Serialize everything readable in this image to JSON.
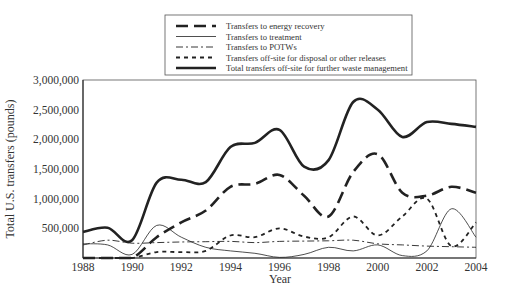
{
  "chart_data": {
    "type": "line",
    "title": "",
    "xlabel": "Year",
    "ylabel": "Total U.S. transfers (pounds)",
    "xlim": [
      1988,
      2004
    ],
    "ylim": [
      0,
      3000000
    ],
    "x_ticks": [
      "1988",
      "1990",
      "1992",
      "1994",
      "1996",
      "1998",
      "2000",
      "2002",
      "2004"
    ],
    "y_ticks": [
      {
        "value": 500000,
        "label": "500,000"
      },
      {
        "value": 1000000,
        "label": "1,000,000"
      },
      {
        "value": 1500000,
        "label": "1,500,000"
      },
      {
        "value": 2000000,
        "label": "2,000,000"
      },
      {
        "value": 2500000,
        "label": "2,500,000"
      },
      {
        "value": 3000000,
        "label": "3,000,000"
      }
    ],
    "grid": false,
    "legend_position": "top-center",
    "x": [
      1988,
      1989,
      1990,
      1991,
      1992,
      1993,
      1994,
      1995,
      1996,
      1997,
      1998,
      1999,
      2000,
      2001,
      2002,
      2003,
      2004
    ],
    "series": [
      {
        "name": "Transfers to energy recovery",
        "style": "long-dash",
        "width": 2.6,
        "values": [
          0,
          0,
          0,
          350000,
          600000,
          800000,
          1200000,
          1250000,
          1400000,
          1050000,
          700000,
          1450000,
          1750000,
          1100000,
          1050000,
          1200000,
          1100000
        ]
      },
      {
        "name": "Transfers to treatment",
        "style": "thin-solid",
        "width": 0.8,
        "values": [
          240000,
          220000,
          60000,
          550000,
          350000,
          180000,
          120000,
          80000,
          10000,
          60000,
          180000,
          120000,
          220000,
          40000,
          120000,
          830000,
          350000
        ]
      },
      {
        "name": "Transfers to POTWs",
        "style": "dash-dot",
        "width": 0.9,
        "values": [
          220000,
          300000,
          250000,
          260000,
          270000,
          275000,
          280000,
          260000,
          280000,
          285000,
          290000,
          300000,
          240000,
          220000,
          200000,
          190000,
          180000
        ]
      },
      {
        "name": "Transfers off-site for disposal or other releases",
        "style": "short-dash",
        "width": 1.8,
        "values": [
          0,
          0,
          0,
          100000,
          100000,
          120000,
          380000,
          350000,
          500000,
          360000,
          350000,
          700000,
          380000,
          700000,
          1000000,
          200000,
          600000
        ]
      },
      {
        "name": "Total transfers off-site for further waste management",
        "style": "thick-solid",
        "width": 2.6,
        "values": [
          440000,
          510000,
          300000,
          1270000,
          1320000,
          1280000,
          1870000,
          1940000,
          2160000,
          1540000,
          1650000,
          2630000,
          2500000,
          2040000,
          2290000,
          2260000,
          2210000
        ]
      }
    ]
  },
  "legend": {
    "items": [
      {
        "label": "Transfers to energy recovery"
      },
      {
        "label": "Transfers to treatment"
      },
      {
        "label": "Transfers to POTWs"
      },
      {
        "label": "Transfers off-site for disposal or other releases"
      },
      {
        "label": "Total transfers off-site for further waste management"
      }
    ]
  },
  "axes": {
    "xlabel": "Year",
    "ylabel": "Total U.S. transfers (pounds)"
  }
}
